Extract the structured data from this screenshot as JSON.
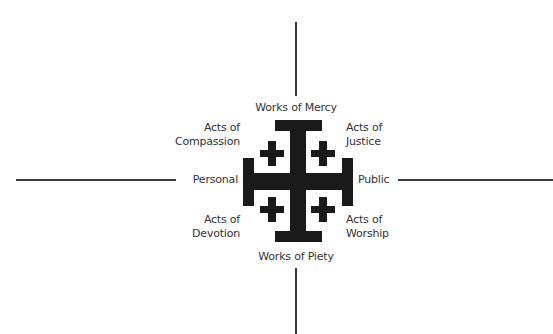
{
  "diagram": {
    "title": "",
    "colors": {
      "background": "#ffffff",
      "cross": "#1a1a1a",
      "axis": "#3a3a3a",
      "text": "#333333"
    },
    "axes": {
      "top_label": "Works of Mercy",
      "bottom_label": "Works of Piety",
      "left_label": "Personal",
      "right_label": "Public"
    },
    "quadrants": {
      "upper_left": {
        "line1": "Acts of",
        "line2": "Compassion"
      },
      "upper_right": {
        "line1": "Acts of",
        "line2": "Justice"
      },
      "lower_left": {
        "line1": "Acts of",
        "line2": "Devotion"
      },
      "lower_right": {
        "line1": "Acts of",
        "line2": "Worship"
      }
    },
    "center_symbol": "jerusalem-cross"
  }
}
